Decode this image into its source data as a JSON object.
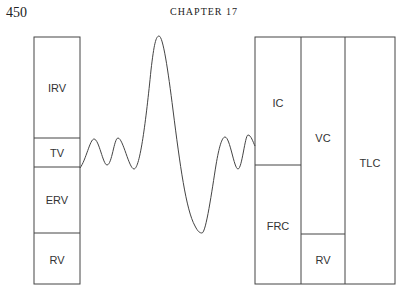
{
  "header": {
    "page_number": "450",
    "chapter": "CHAPTER 17"
  },
  "diagram": {
    "left_column": {
      "segments": [
        {
          "label": "IRV",
          "top": 37,
          "bottom": 138
        },
        {
          "label": "TV",
          "top": 138,
          "bottom": 167
        },
        {
          "label": "ERV",
          "top": 167,
          "bottom": 233
        },
        {
          "label": "RV",
          "top": 233,
          "bottom": 284
        }
      ]
    },
    "right_columns": [
      {
        "segments": [
          {
            "label": "IC"
          },
          {
            "label": "FRC"
          }
        ]
      },
      {
        "segments": [
          {
            "label": "VC"
          },
          {
            "label": "RV"
          }
        ]
      },
      {
        "segments": [
          {
            "label": "TLC"
          }
        ]
      }
    ],
    "labels": {
      "irv": "IRV",
      "tv": "TV",
      "erv": "ERV",
      "rv_left": "RV",
      "ic": "IC",
      "frc": "FRC",
      "vc": "VC",
      "rv_right": "RV",
      "tlc": "TLC"
    },
    "line_color": "#444444"
  }
}
